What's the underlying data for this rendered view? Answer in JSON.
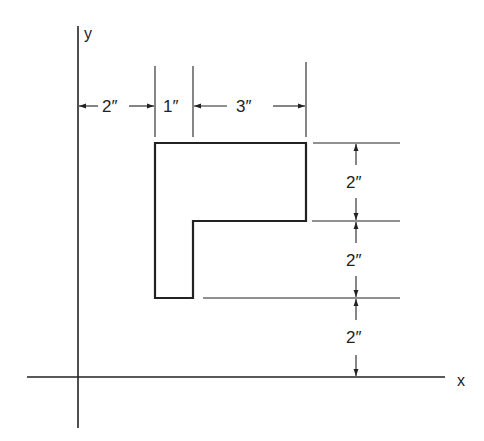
{
  "diagram": {
    "type": "dimensioned L-shaped area on x-y axes",
    "axes": {
      "x_label": "x",
      "y_label": "y"
    },
    "horizontal_dimensions": [
      {
        "label": "2″",
        "from": "y-axis",
        "to": "shape left edge"
      },
      {
        "label": "1″",
        "from": "shape left edge",
        "to": "inner step"
      },
      {
        "label": "3″",
        "from": "inner step",
        "to": "shape right edge"
      }
    ],
    "vertical_dimensions": [
      {
        "label": "2″",
        "from": "top edge",
        "to": "step edge"
      },
      {
        "label": "2″",
        "from": "step edge",
        "to": "bottom edge"
      },
      {
        "label": "2″",
        "from": "bottom edge",
        "to": "x-axis"
      }
    ],
    "colors": {
      "line": "#222222",
      "background": "#ffffff"
    }
  }
}
